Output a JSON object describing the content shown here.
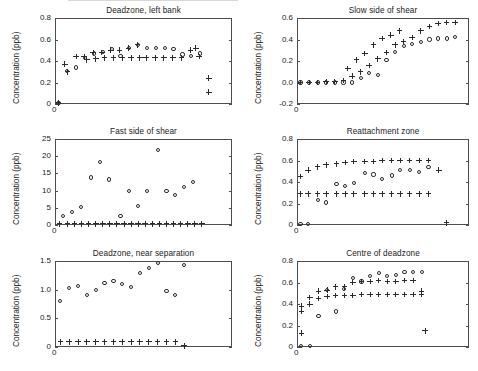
{
  "figure": {
    "width": 478,
    "height": 371,
    "background": "#ffffff",
    "ink_color": "#2b2b2b",
    "axis_color": "#4d4d4d"
  },
  "common": {
    "ylabel": "Concentration (ppb)",
    "xorigin_label": "0",
    "marker_circle_name": "open-circle-marker",
    "marker_plus_name": "plus-marker"
  },
  "chart_data": [
    {
      "id": "deadzone-left-bank",
      "type": "scatter",
      "title": "Deadzone, left bank",
      "xlabel": "",
      "ylabel": "Concentration (ppb)",
      "ylim": [
        0,
        0.8
      ],
      "yticks": [
        0,
        0.2,
        0.4,
        0.6,
        0.8
      ],
      "ytick_labels": [
        "0",
        "0.2",
        "0.4",
        "0.6",
        "0.8"
      ],
      "xlim": [
        0,
        20
      ],
      "grid": false,
      "legend": "none",
      "series": [
        {
          "name": "circles",
          "marker": "circle",
          "x": [
            0.4,
            1.4,
            2.4,
            3.4,
            4.4,
            5.4,
            6.4,
            7.4,
            8.4,
            9.4,
            10.4,
            11.4,
            12.4,
            13.4,
            14.4,
            15.4,
            16.4,
            17.4,
            18.4
          ],
          "y": [
            0.01,
            0.31,
            0.34,
            0.43,
            0.47,
            0.48,
            0.51,
            0.45,
            0.52,
            0.55,
            0.52,
            0.52,
            0.52,
            0.51,
            0.46,
            0.45,
            0.47,
            null,
            null
          ]
        },
        {
          "name": "plus",
          "marker": "plus",
          "x": [
            0.4,
            1.1,
            1.4,
            2.4,
            3.3,
            3.6,
            4.3,
            4.6,
            5.3,
            5.6,
            6.3,
            6.6,
            7.3,
            7.6,
            8.3,
            8.6,
            9.3,
            9.6,
            10.3,
            11.3,
            12.3,
            13.3,
            14.3,
            15.3,
            15.9,
            16.3,
            17.4,
            17.4
          ],
          "y": [
            0.01,
            0.37,
            0.3,
            0.44,
            0.44,
            0.41,
            0.48,
            0.42,
            0.48,
            0.43,
            0.5,
            0.43,
            0.5,
            0.43,
            0.52,
            0.43,
            0.55,
            0.43,
            0.43,
            0.43,
            0.43,
            0.43,
            0.43,
            0.5,
            0.52,
            0.44,
            0.24,
            0.11
          ]
        }
      ]
    },
    {
      "id": "slow-side-of-shear",
      "type": "scatter",
      "title": "Slow side of shear",
      "xlabel": "",
      "ylabel": "Concentration (ppb)",
      "ylim": [
        -0.2,
        0.6
      ],
      "yticks": [
        -0.2,
        0.0,
        0.2,
        0.4,
        0.6
      ],
      "ytick_labels": [
        "-0.2",
        "0.0",
        "0.2",
        "0.4",
        "0.6"
      ],
      "xlim": [
        0,
        20
      ],
      "grid": false,
      "legend": "none",
      "series": [
        {
          "name": "circles",
          "marker": "circle",
          "x": [
            0.4,
            1.4,
            2.4,
            3.4,
            4.4,
            5.4,
            6.4,
            7.4,
            8.4,
            9.4,
            10.4,
            11.4,
            12.4,
            13.4,
            14.4,
            15.4,
            16.4,
            17.4,
            18.4
          ],
          "y": [
            0.0,
            0.0,
            0.0,
            0.0,
            0.0,
            0.0,
            0.0,
            0.04,
            0.09,
            0.07,
            0.21,
            0.28,
            0.34,
            0.36,
            0.38,
            0.4,
            0.41,
            0.41,
            0.42
          ]
        },
        {
          "name": "plus",
          "marker": "plus",
          "x": [
            0.4,
            1.4,
            2.4,
            3.4,
            4.4,
            5.4,
            6.4,
            7.4,
            8.4,
            9.4,
            10.4,
            11.4,
            12.4,
            13.4,
            14.4,
            15.4,
            16.4,
            17.4,
            18.4,
            5.9,
            6.9,
            7.9,
            8.9,
            9.9,
            10.9,
            11.9
          ],
          "y": [
            0.0,
            0.0,
            0.0,
            0.01,
            0.01,
            0.02,
            0.06,
            0.1,
            0.16,
            0.22,
            0.28,
            0.35,
            0.38,
            0.42,
            0.48,
            0.52,
            0.55,
            0.56,
            0.56,
            0.13,
            0.21,
            0.27,
            0.35,
            0.41,
            0.44,
            0.48
          ]
        }
      ]
    },
    {
      "id": "fast-side-of-shear",
      "type": "scatter",
      "title": "Fast side of shear",
      "xlabel": "",
      "ylabel": "Concentration (ppb)",
      "ylim": [
        0,
        25
      ],
      "yticks": [
        0,
        5,
        10,
        15,
        20,
        25
      ],
      "ytick_labels": [
        "0",
        "5",
        "10",
        "15",
        "20",
        "25"
      ],
      "xlim": [
        0,
        20
      ],
      "grid": false,
      "legend": "none",
      "series": [
        {
          "name": "circles",
          "marker": "circle",
          "x": [
            0.9,
            1.9,
            2.9,
            4.1,
            5.1,
            6.1,
            7.4,
            8.4,
            9.4,
            10.4,
            11.6,
            12.6,
            13.6,
            14.6,
            15.6,
            16.6
          ],
          "y": [
            2.6,
            3.7,
            5.2,
            13.8,
            18.4,
            13.2,
            2.5,
            9.8,
            5.6,
            10.0,
            21.8,
            10.0,
            8.8,
            11.0,
            12.4,
            null
          ]
        },
        {
          "name": "plus",
          "marker": "plus",
          "x": [
            0.5,
            1.4,
            2.2,
            3.0,
            3.8,
            4.6,
            5.4,
            6.2,
            7.0,
            7.8,
            8.6,
            9.4,
            10.2,
            11.0,
            11.8,
            12.6,
            13.4,
            14.2,
            15.0,
            15.8,
            16.6
          ],
          "y": [
            0.3,
            0.3,
            0.3,
            0.3,
            0.3,
            0.3,
            0.3,
            0.3,
            0.3,
            0.3,
            0.3,
            0.3,
            0.3,
            0.3,
            0.3,
            0.3,
            0.3,
            0.3,
            0.3,
            0.3,
            0.3
          ]
        }
      ]
    },
    {
      "id": "reattachment-zone",
      "type": "scatter",
      "title": "Reattachment zone",
      "xlabel": "",
      "ylabel": "Concentration (ppb)",
      "ylim": [
        0,
        0.8
      ],
      "yticks": [
        0,
        0.2,
        0.4,
        0.6,
        0.8
      ],
      "ytick_labels": [
        "0",
        "0.2",
        "0.4",
        "0.6",
        "0.8"
      ],
      "xlim": [
        0,
        20
      ],
      "grid": false,
      "legend": "none",
      "series": [
        {
          "name": "circles",
          "marker": "circle",
          "x": [
            0.4,
            1.3,
            2.4,
            3.4,
            4.6,
            5.6,
            6.6,
            7.9,
            8.9,
            9.9,
            11.0,
            12.0,
            13.1,
            14.2,
            15.3,
            16.5,
            17.4
          ],
          "y": [
            0.01,
            0.01,
            0.23,
            0.21,
            0.38,
            0.36,
            0.39,
            0.48,
            0.47,
            0.43,
            0.46,
            0.51,
            0.51,
            0.49,
            0.54,
            null,
            null
          ]
        },
        {
          "name": "plus",
          "marker": "plus",
          "x": [
            0.4,
            1.3,
            2.4,
            3.4,
            4.6,
            5.6,
            6.6,
            7.9,
            8.9,
            9.9,
            11.0,
            12.0,
            13.1,
            14.2,
            15.3,
            16.5,
            17.4
          ],
          "y": [
            0.45,
            0.51,
            0.54,
            0.56,
            0.57,
            0.58,
            0.59,
            0.59,
            0.59,
            0.6,
            0.6,
            0.6,
            0.6,
            0.6,
            0.6,
            0.51,
            0.02
          ]
        },
        {
          "name": "plus-baseline",
          "marker": "plus",
          "x": [
            0.4,
            1.3,
            2.4,
            3.4,
            4.6,
            5.6,
            6.6,
            7.9,
            8.9,
            9.9,
            11.0,
            12.0,
            13.1,
            14.2,
            15.3
          ],
          "y": [
            0.29,
            0.29,
            0.29,
            0.29,
            0.29,
            0.29,
            0.29,
            0.29,
            0.29,
            0.29,
            0.29,
            0.29,
            0.29,
            0.29,
            0.29
          ]
        }
      ]
    },
    {
      "id": "deadzone-near-separation",
      "type": "scatter",
      "title": "Deadzone, near separation",
      "xlabel": "",
      "ylabel": "Concentration (ppb)",
      "ylim": [
        0,
        1.5
      ],
      "yticks": [
        0,
        0.5,
        1.0,
        1.5
      ],
      "ytick_labels": [
        "0",
        "0.5",
        "1.0",
        "1.5"
      ],
      "xlim": [
        0,
        20
      ],
      "grid": false,
      "legend": "none",
      "series": [
        {
          "name": "circles",
          "marker": "circle",
          "x": [
            0.6,
            1.6,
            2.6,
            3.6,
            4.6,
            5.6,
            6.6,
            7.6,
            8.6,
            9.6,
            10.6,
            11.6,
            12.6,
            13.6,
            14.6,
            15.6
          ],
          "y": [
            0.8,
            1.03,
            1.06,
            0.91,
            0.99,
            1.12,
            1.15,
            1.1,
            1.04,
            1.29,
            1.38,
            1.47,
            0.98,
            0.9,
            1.43,
            null
          ]
        },
        {
          "name": "plus",
          "marker": "plus",
          "x": [
            0.6,
            1.6,
            2.6,
            3.6,
            4.6,
            5.6,
            6.6,
            7.6,
            8.6,
            9.6,
            10.6,
            11.6,
            12.6,
            13.6,
            14.6
          ],
          "y": [
            0.09,
            0.09,
            0.09,
            0.09,
            0.09,
            0.09,
            0.09,
            0.09,
            0.09,
            0.09,
            0.09,
            0.09,
            0.09,
            0.09,
            0.02
          ]
        }
      ]
    },
    {
      "id": "centre-of-deadzone",
      "type": "scatter",
      "title": "Centre of deadzone",
      "xlabel": "",
      "ylabel": "Concentration (ppb)",
      "ylim": [
        0,
        0.8
      ],
      "yticks": [
        0,
        0.2,
        0.4,
        0.6,
        0.8
      ],
      "ytick_labels": [
        "0",
        "0.2",
        "0.4",
        "0.6",
        "0.8"
      ],
      "xlim": [
        0,
        20
      ],
      "grid": false,
      "legend": "none",
      "series": [
        {
          "name": "circles",
          "marker": "circle",
          "x": [
            0.5,
            1.5,
            2.5,
            3.5,
            4.5,
            5.5,
            6.5,
            7.5,
            8.5,
            9.5,
            10.5,
            11.5,
            12.5,
            13.5,
            14.5,
            15.5,
            16.5
          ],
          "y": [
            0.01,
            0.01,
            0.29,
            0.53,
            0.33,
            0.54,
            0.64,
            0.61,
            0.66,
            0.69,
            0.66,
            0.67,
            0.7,
            0.7,
            0.7,
            null,
            null
          ]
        },
        {
          "name": "plus-upper",
          "marker": "plus",
          "x": [
            0.5,
            1.5,
            2.5,
            3.5,
            4.5,
            5.5,
            6.5,
            7.5,
            8.5,
            9.5,
            10.5,
            11.5,
            12.5,
            13.5,
            14.5
          ],
          "y": [
            0.38,
            0.46,
            0.52,
            0.53,
            0.56,
            0.56,
            0.6,
            0.61,
            0.61,
            0.62,
            0.61,
            0.61,
            0.62,
            0.62,
            0.52
          ]
        },
        {
          "name": "plus-lower",
          "marker": "plus",
          "x": [
            0.5,
            1.5,
            2.5,
            3.5,
            4.5,
            5.5,
            6.5,
            7.5,
            8.5,
            9.5,
            10.5,
            11.5,
            12.5,
            13.5,
            14.5,
            0.5,
            14.9
          ],
          "y": [
            0.33,
            0.4,
            0.45,
            0.47,
            0.48,
            0.48,
            0.48,
            0.49,
            0.49,
            0.49,
            0.49,
            0.49,
            0.49,
            0.49,
            0.49,
            0.13,
            0.15
          ]
        }
      ]
    }
  ]
}
